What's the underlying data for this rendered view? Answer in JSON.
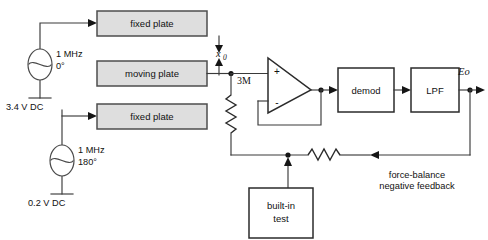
{
  "diagram": {
    "colors": {
      "plate_fill": "#dedede",
      "box_fill": "#ffffff",
      "stroke": "#2b2b2b",
      "wire": "#3a3a3a",
      "background": "#ffffff"
    },
    "plates": [
      {
        "id": "fixed-plate-top",
        "label": "fixed plate"
      },
      {
        "id": "moving-plate",
        "label": "moving plate"
      },
      {
        "id": "fixed-plate-bottom",
        "label": "fixed plate"
      }
    ],
    "sources": [
      {
        "id": "oscillator-top",
        "freq": "1 MHz",
        "phase": "0°",
        "bias": "3.4 V DC",
        "symbol": "ac-source-icon"
      },
      {
        "id": "oscillator-bottom",
        "freq": "1 MHz",
        "phase": "180°",
        "bias": "0.2 V DC",
        "symbol": "ac-source-icon"
      }
    ],
    "gap": {
      "label": "x",
      "subscript": "0"
    },
    "input_resistor": {
      "label": "3M",
      "symbol": "resistor-icon"
    },
    "opamp": {
      "plus": "+",
      "minus": "-",
      "name": "operational-amplifier"
    },
    "blocks": [
      {
        "id": "demod",
        "label": "demod"
      },
      {
        "id": "lpf",
        "label": "LPF"
      },
      {
        "id": "built-in-test",
        "label_line1": "built-in",
        "label_line2": "test"
      }
    ],
    "output": {
      "label": "Eo"
    },
    "feedback": {
      "label_line1": "force-balance",
      "label_line2": "negative feedback",
      "resistor_symbol": "resistor-icon"
    }
  }
}
